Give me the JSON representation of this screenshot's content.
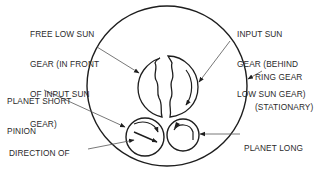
{
  "diagram": {
    "type": "planetary-gearset",
    "colors": {
      "line": "#1e1e1e",
      "leader": "#555555",
      "text": "#2a2a2a",
      "background": "#ffffff"
    },
    "labels": {
      "free_low_sun_gear": [
        "FREE LOW SUN",
        "GEAR (IN FRONT",
        "OF INPUT SUN",
        "GEAR)"
      ],
      "input_sun_gear": [
        "INPUT SUN",
        "GEAR (BEHIND",
        "LOW SUN GEAR)"
      ],
      "ring_gear": [
        "RING GEAR",
        "(STATIONARY)"
      ],
      "planet_short_pinion": [
        "PLANET SHORT",
        "PINION"
      ],
      "direction_cage": [
        "DIRECTION OF",
        "PLANET–PINION",
        "CAGE AND",
        "OUTPUT SHAFT"
      ],
      "planet_long_pinion": [
        "PLANET LONG",
        "PINION"
      ]
    },
    "components": [
      "ring-gear",
      "free-low-sun-gear",
      "input-sun-gear",
      "planet-short-pinion",
      "planet-long-pinion"
    ]
  }
}
